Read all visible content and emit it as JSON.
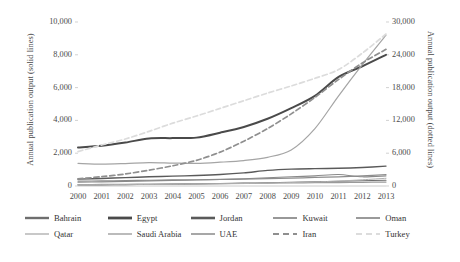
{
  "chart_data": {
    "type": "line",
    "title": "",
    "subtitle": "",
    "xlabel": "",
    "ylabel": "Annual publication output (solid lines)",
    "y2label": "Annual publication output (dotted lines)",
    "x": [
      2000,
      2001,
      2002,
      2003,
      2004,
      2005,
      2006,
      2007,
      2008,
      2009,
      2010,
      2011,
      2012,
      2013
    ],
    "categories": [
      "2000",
      "2001",
      "2002",
      "2003",
      "2004",
      "2005",
      "2006",
      "2007",
      "2008",
      "2009",
      "2010",
      "2011",
      "2012",
      "2013"
    ],
    "ylim": [
      0,
      10000
    ],
    "y2lim": [
      0,
      30000
    ],
    "yticks": [
      0,
      2000,
      4000,
      6000,
      8000,
      10000
    ],
    "ytick_labels": [
      "0",
      "2,000",
      "4,000",
      "6,000",
      "8,000",
      "10,000"
    ],
    "y2ticks": [
      0,
      6000,
      12000,
      18000,
      24000,
      30000
    ],
    "y2tick_labels": [
      "0",
      "6,000",
      "12,000",
      "18,000",
      "24,000",
      "30,000"
    ],
    "grid": false,
    "legend_position": "bottom",
    "series": [
      {
        "name": "Bahrain",
        "axis": "left",
        "style": "solid",
        "color": "#6e6e6e",
        "width": 1.1,
        "values": [
          60,
          70,
          80,
          95,
          110,
          125,
          150,
          175,
          200,
          230,
          260,
          290,
          320,
          350
        ]
      },
      {
        "name": "Egypt",
        "axis": "left",
        "style": "solid",
        "color": "#4a4a4a",
        "width": 2.0,
        "values": [
          2350,
          2450,
          2650,
          2900,
          2920,
          2950,
          3250,
          3600,
          4100,
          4750,
          5500,
          6650,
          7300,
          8000
        ]
      },
      {
        "name": "Jordan",
        "axis": "left",
        "style": "solid",
        "color": "#5a5a5a",
        "width": 1.4,
        "values": [
          420,
          460,
          510,
          560,
          600,
          640,
          700,
          800,
          950,
          1030,
          1060,
          1080,
          1130,
          1210
        ]
      },
      {
        "name": "Kuwait",
        "axis": "left",
        "style": "solid",
        "color": "#8d8d8d",
        "width": 1.2,
        "values": [
          300,
          310,
          330,
          350,
          370,
          380,
          400,
          420,
          450,
          480,
          520,
          560,
          620,
          700
        ]
      },
      {
        "name": "Oman",
        "axis": "left",
        "style": "solid",
        "color": "#9a9a9a",
        "width": 1.2,
        "values": [
          90,
          95,
          105,
          115,
          125,
          135,
          145,
          160,
          175,
          190,
          200,
          210,
          225,
          240
        ]
      },
      {
        "name": "Qatar",
        "axis": "left",
        "style": "solid",
        "color": "#b0b0b0",
        "width": 1.0,
        "values": [
          70,
          75,
          85,
          95,
          105,
          115,
          130,
          150,
          175,
          210,
          250,
          300,
          380,
          470
        ]
      },
      {
        "name": "Saudi Arabia",
        "axis": "left",
        "style": "solid",
        "color": "#a5a5a5",
        "width": 1.2,
        "values": [
          1380,
          1330,
          1370,
          1430,
          1400,
          1380,
          1450,
          1550,
          1750,
          2200,
          3500,
          5500,
          7400,
          9200
        ]
      },
      {
        "name": "UAE",
        "axis": "left",
        "style": "solid",
        "color": "#8a8a8a",
        "width": 1.1,
        "values": [
          230,
          250,
          280,
          310,
          340,
          370,
          400,
          440,
          500,
          560,
          620,
          700,
          560,
          620
        ]
      },
      {
        "name": "Iran",
        "axis": "right",
        "style": "dashed",
        "color": "#8f8f8f",
        "width": 1.7,
        "values": [
          1300,
          1700,
          2200,
          2900,
          3700,
          4700,
          6200,
          8200,
          10500,
          13200,
          16200,
          19500,
          22500,
          25000
        ]
      },
      {
        "name": "Turkey",
        "axis": "right",
        "style": "dashed",
        "color": "#dcdcdc",
        "width": 1.7,
        "values": [
          6300,
          7500,
          8600,
          10000,
          11500,
          12800,
          14200,
          15600,
          17000,
          18300,
          19700,
          21300,
          24300,
          27800
        ]
      }
    ]
  },
  "axes": {
    "left_title": "Annual publication output (solid lines)",
    "right_title": "Annual publication output (dotted lines)"
  },
  "legend": {
    "rows": [
      [
        {
          "label": "Bahrain",
          "color": "#6e6e6e",
          "style": "solid",
          "width": 2.4
        },
        {
          "label": "Egypt",
          "color": "#4a4a4a",
          "style": "solid",
          "width": 2.8
        },
        {
          "label": "Jordan",
          "color": "#5a5a5a",
          "style": "solid",
          "width": 2.6
        },
        {
          "label": "Kuwait",
          "color": "#8d8d8d",
          "style": "solid",
          "width": 1.8
        },
        {
          "label": "Oman",
          "color": "#9a9a9a",
          "style": "solid",
          "width": 2.0
        }
      ],
      [
        {
          "label": "Qatar",
          "color": "#b0b0b0",
          "style": "solid",
          "width": 1.4
        },
        {
          "label": "Saudi Arabia",
          "color": "#a5a5a5",
          "style": "solid",
          "width": 1.5
        },
        {
          "label": "UAE",
          "color": "#8a8a8a",
          "style": "solid",
          "width": 1.5
        },
        {
          "label": "Iran",
          "color": "#8f8f8f",
          "style": "dashed",
          "width": 1.8
        },
        {
          "label": "Turkey",
          "color": "#dcdcdc",
          "style": "dashed",
          "width": 1.8
        }
      ]
    ]
  },
  "colors": {
    "axis_line": "#bfbfbf",
    "text": "#4a4a4a",
    "background": "#ffffff"
  }
}
